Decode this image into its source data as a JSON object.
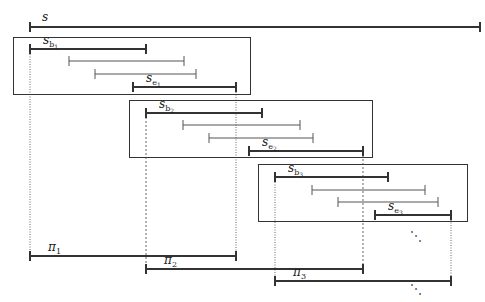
{
  "figure": {
    "type": "interval-segmentation-diagram",
    "top_segment": {
      "label": "s",
      "x1": 30,
      "x2": 480,
      "y": 27
    },
    "blocks": [
      {
        "box": {
          "x": 13,
          "y": 37,
          "w": 237,
          "h": 57
        },
        "segments": [
          {
            "label": "s",
            "sub": "b",
            "subsub": "1",
            "x1": 30,
            "x2": 146,
            "y": 49,
            "bold": true
          },
          {
            "label": "",
            "x1": 69,
            "x2": 184,
            "y": 61,
            "bold": false
          },
          {
            "label": "",
            "x1": 95,
            "x2": 196,
            "y": 74,
            "bold": false
          },
          {
            "label": "s",
            "sub": "e",
            "subsub": "1",
            "x1": 133,
            "x2": 236,
            "y": 87,
            "bold": true
          }
        ]
      },
      {
        "box": {
          "x": 129,
          "y": 100,
          "w": 243,
          "h": 57
        },
        "segments": [
          {
            "label": "s",
            "sub": "b",
            "subsub": "2",
            "x1": 146,
            "x2": 262,
            "y": 113,
            "bold": true
          },
          {
            "label": "",
            "x1": 183,
            "x2": 300,
            "y": 125,
            "bold": false
          },
          {
            "label": "",
            "x1": 209,
            "x2": 313,
            "y": 138,
            "bold": false
          },
          {
            "label": "s",
            "sub": "e",
            "subsub": "2",
            "x1": 249,
            "x2": 363,
            "y": 151,
            "bold": true
          }
        ]
      },
      {
        "box": {
          "x": 258,
          "y": 164,
          "w": 209,
          "h": 57
        },
        "segments": [
          {
            "label": "s",
            "sub": "b",
            "subsub": "3",
            "x1": 275,
            "x2": 388,
            "y": 177,
            "bold": true
          },
          {
            "label": "",
            "x1": 312,
            "x2": 425,
            "y": 190,
            "bold": false
          },
          {
            "label": "",
            "x1": 338,
            "x2": 438,
            "y": 202,
            "bold": false
          },
          {
            "label": "s",
            "sub": "e",
            "subsub": "3",
            "x1": 375,
            "x2": 451,
            "y": 215,
            "bold": true
          }
        ]
      }
    ],
    "pi_segments": [
      {
        "label": "π",
        "sub": "1",
        "x1": 30,
        "x2": 236,
        "y": 256
      },
      {
        "label": "π",
        "sub": "2",
        "x1": 146,
        "x2": 363,
        "y": 269
      },
      {
        "label": "π",
        "sub": "3",
        "x1": 275,
        "x2": 451,
        "y": 281
      }
    ],
    "guide_lines": [
      {
        "x": 30,
        "y1": 49,
        "y2": 256,
        "style": "dotted"
      },
      {
        "x": 236,
        "y1": 87,
        "y2": 256,
        "style": "dotted"
      },
      {
        "x": 146,
        "y1": 113,
        "y2": 269,
        "style": "dashed"
      },
      {
        "x": 363,
        "y1": 151,
        "y2": 269,
        "style": "dashed"
      },
      {
        "x": 275,
        "y1": 177,
        "y2": 281,
        "style": "dotted"
      },
      {
        "x": 451,
        "y1": 215,
        "y2": 281,
        "style": "dotted"
      }
    ],
    "ellipses": [
      {
        "text": "⋱",
        "x": 410,
        "y": 240
      },
      {
        "text": "⋱",
        "x": 410,
        "y": 293
      }
    ],
    "colors": {
      "stroke": "#333333",
      "thin": "#555555",
      "guide": "#666666"
    }
  }
}
